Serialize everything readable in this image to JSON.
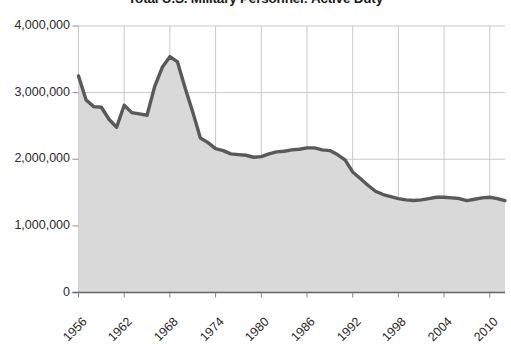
{
  "chart_data": {
    "type": "area",
    "title": "Total U.S. Military Personnel: Active Duty",
    "xlabel": "",
    "ylabel": "",
    "ylim": [
      0,
      4000000
    ],
    "xlim": [
      1956,
      2012
    ],
    "grid": true,
    "legend": false,
    "legend_position": "none",
    "line_color": "#595959",
    "fill_color": "#d9d9d9",
    "ytick_labels": [
      "0",
      "1,000,000",
      "2,000,000",
      "3,000,000",
      "4,000,000"
    ],
    "ytick_values": [
      0,
      1000000,
      2000000,
      3000000,
      4000000
    ],
    "xtick_labels": [
      "1956",
      "1962",
      "1968",
      "1974",
      "1980",
      "1986",
      "1992",
      "1998",
      "2004",
      "2010"
    ],
    "xtick_values": [
      1956,
      1962,
      1968,
      1974,
      1980,
      1986,
      1992,
      1998,
      2004,
      2010
    ],
    "x": [
      1956,
      1957,
      1958,
      1959,
      1960,
      1961,
      1962,
      1963,
      1964,
      1965,
      1966,
      1967,
      1968,
      1969,
      1970,
      1971,
      1972,
      1973,
      1974,
      1975,
      1976,
      1977,
      1978,
      1979,
      1980,
      1981,
      1982,
      1983,
      1984,
      1985,
      1986,
      1987,
      1988,
      1989,
      1990,
      1991,
      1992,
      1993,
      1994,
      1995,
      1996,
      1997,
      1998,
      1999,
      2000,
      2001,
      2002,
      2003,
      2004,
      2005,
      2006,
      2007,
      2008,
      2009,
      2010,
      2011,
      2012
    ],
    "values": [
      3250000,
      2890000,
      2790000,
      2780000,
      2600000,
      2480000,
      2810000,
      2700000,
      2680000,
      2660000,
      3090000,
      3380000,
      3540000,
      3460000,
      3070000,
      2710000,
      2320000,
      2250000,
      2160000,
      2130000,
      2080000,
      2070000,
      2060000,
      2030000,
      2040000,
      2080000,
      2110000,
      2120000,
      2140000,
      2150000,
      2170000,
      2170000,
      2140000,
      2130000,
      2070000,
      1990000,
      1810000,
      1710000,
      1610000,
      1520000,
      1470000,
      1440000,
      1410000,
      1390000,
      1380000,
      1390000,
      1410000,
      1430000,
      1430000,
      1420000,
      1410000,
      1380000,
      1400000,
      1420000,
      1430000,
      1410000,
      1380000
    ]
  }
}
